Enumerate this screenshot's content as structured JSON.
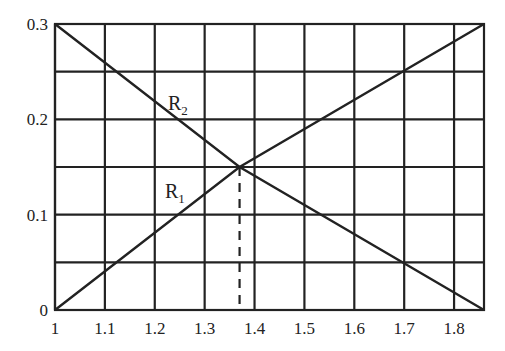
{
  "chart_data": {
    "type": "line",
    "title": "",
    "xlabel": "",
    "ylabel": "",
    "xlim": [
      1,
      1.86
    ],
    "ylim": [
      0,
      0.3
    ],
    "grid": true,
    "x_ticks": [
      "1",
      "1.1",
      "1.2",
      "1.3",
      "1.4",
      "1.5",
      "1.6",
      "1.7",
      "1.8"
    ],
    "y_ticks": [
      "0",
      "0.1",
      "0.2",
      "0.3"
    ],
    "y_grid_step": 0.05,
    "series": [
      {
        "name": "R1",
        "label_main": "R",
        "label_sub": "1",
        "x": [
          1,
          1.37,
          1.86
        ],
        "y": [
          0.3,
          0.15,
          0
        ]
      },
      {
        "name": "R2",
        "label_main": "R",
        "label_sub": "2",
        "x": [
          1,
          1.37,
          1.86
        ],
        "y": [
          0,
          0.15,
          0.3
        ]
      }
    ],
    "annotations": [
      {
        "type": "dashed-vertical-line",
        "x": 1.37,
        "y_from": 0,
        "y_to": 0.15,
        "note": "intersection of R1 and R2"
      }
    ],
    "legend": "inline labels"
  }
}
